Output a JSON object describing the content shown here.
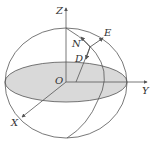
{
  "diagram": {
    "type": "celestial-sphere-coordinate-diagram",
    "labels": {
      "z_axis": "Z",
      "y_axis": "Y",
      "x_axis": "X",
      "origin": "O",
      "north": "N",
      "east": "E",
      "down": "D"
    },
    "colors": {
      "line": "#555555",
      "equator_fill": "#d9d9d9",
      "background": "#ffffff"
    }
  }
}
